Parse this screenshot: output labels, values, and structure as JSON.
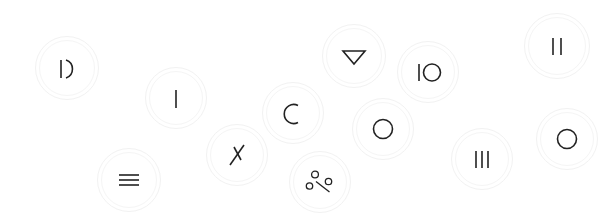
{
  "canvas": {
    "width": 613,
    "height": 224,
    "background": "#ffffff",
    "ring_color": "#f2f2f2",
    "glyph_color": "#222222"
  },
  "badges": [
    {
      "id": "bar-arc",
      "icon": "bar-arc-icon",
      "label": "|)",
      "x": 35,
      "y": 36,
      "size": 64
    },
    {
      "id": "vertical-bar",
      "icon": "vertical-bar-icon",
      "label": "|",
      "x": 145,
      "y": 67,
      "size": 62
    },
    {
      "id": "crescent",
      "icon": "crescent-icon",
      "label": "C",
      "x": 262,
      "y": 82,
      "size": 62
    },
    {
      "id": "triangle-down",
      "icon": "triangle-down-icon",
      "label": "▽",
      "x": 322,
      "y": 24,
      "size": 64
    },
    {
      "id": "power-bar-circle",
      "icon": "power-bar-circle-icon",
      "label": "|O",
      "x": 397,
      "y": 41,
      "size": 62
    },
    {
      "id": "double-bar",
      "icon": "double-bar-icon",
      "label": "||",
      "x": 524,
      "y": 13,
      "size": 66
    },
    {
      "id": "circle-outline-a",
      "icon": "circle-outline-icon",
      "label": "O",
      "x": 352,
      "y": 98,
      "size": 62
    },
    {
      "id": "circle-outline-b",
      "icon": "circle-outline-icon",
      "label": "O",
      "x": 536,
      "y": 108,
      "size": 62
    },
    {
      "id": "crossed-slash",
      "icon": "crossed-slash-icon",
      "label": "✗",
      "x": 206,
      "y": 124,
      "size": 62
    },
    {
      "id": "triple-bar",
      "icon": "triple-bar-icon",
      "label": "|||",
      "x": 451,
      "y": 128,
      "size": 62
    },
    {
      "id": "hamburger",
      "icon": "hamburger-menu-icon",
      "label": "≡",
      "x": 97,
      "y": 148,
      "size": 64
    },
    {
      "id": "scatter-dots",
      "icon": "scatter-dots-icon",
      "label": "°∕°",
      "x": 289,
      "y": 151,
      "size": 62
    }
  ]
}
